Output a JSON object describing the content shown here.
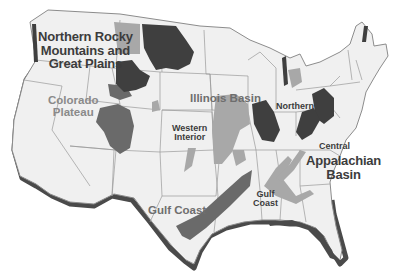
{
  "map": {
    "subject": "Coal basins of the conterminous United States",
    "colors": {
      "land": "#f0f0f0",
      "state_border": "#8c8c8c",
      "coast_shadow": "#4a4a4a",
      "basin_dark": "#3f3f3f",
      "basin_medium": "#6a6a6a",
      "basin_light": "#a8a8a8",
      "background": "#ffffff"
    },
    "labels": {
      "northern_rocky": [
        "Northern Rocky",
        "Mountains and",
        "Great Plains"
      ],
      "colorado_plateau": [
        "Colorado",
        "Plateau"
      ],
      "illinois_basin": "Illinois Basin",
      "western_interior": [
        "Western",
        "Interior"
      ],
      "northern_appalachian": "Northern",
      "central_appalachian": "Central",
      "appalachian_basin": [
        "Appalachian",
        "Basin"
      ],
      "gulf_coast_west": "Gulf Coast",
      "gulf_coast_east": [
        "Gulf",
        "Coast"
      ]
    }
  }
}
